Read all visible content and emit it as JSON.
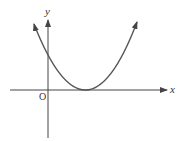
{
  "diagram": {
    "type": "function-graph",
    "axes": {
      "x_label": "x",
      "y_label": "y",
      "origin_label": "O"
    },
    "curve": {
      "shape": "parabola",
      "opens": "up",
      "vertex_on_x_axis": true,
      "color": "#555555"
    },
    "axis_color": "#444444"
  }
}
